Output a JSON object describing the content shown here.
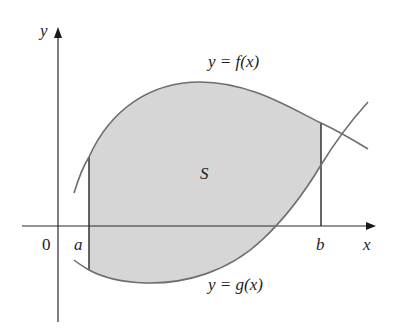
{
  "figure": {
    "colors": {
      "fill": "#d6d6d6",
      "curve": "#6e6e6e",
      "axis": "#2a2a2a",
      "text": "#1e1e1e"
    },
    "labels": {
      "y_axis": "y",
      "x_axis": "x",
      "origin": "0",
      "a": "a",
      "b": "b",
      "region": "S",
      "f_curve": "y = f(x)",
      "g_curve": "y = g(x)"
    }
  }
}
